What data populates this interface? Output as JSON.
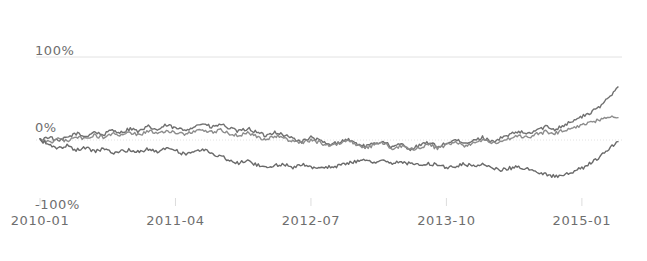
{
  "chart_data": {
    "type": "line",
    "title": "",
    "subtitle": "",
    "xlabel": "",
    "ylabel": "",
    "grid": true,
    "legend_position": "none",
    "background_color": "#ffffff",
    "axis_text_color": "#6e6e6e",
    "gridline_color": "#e2e2e2",
    "ylim": [
      -100,
      100
    ],
    "ytick_labels": [
      "100%",
      "0%",
      "-100%"
    ],
    "ytick_values": [
      100,
      0,
      -100
    ],
    "xtick_labels": [
      "2010-01",
      "2011-04",
      "2012-07",
      "2013-10",
      "2015-01"
    ],
    "xtick_positions": [
      0,
      15,
      30,
      45,
      60
    ],
    "x_unit": "months since 2010-01",
    "x": [
      0,
      1,
      2,
      3,
      4,
      5,
      6,
      7,
      8,
      9,
      10,
      11,
      12,
      13,
      14,
      15,
      16,
      17,
      18,
      19,
      20,
      21,
      22,
      23,
      24,
      25,
      26,
      27,
      28,
      29,
      30,
      31,
      32,
      33,
      34,
      35,
      36,
      37,
      38,
      39,
      40,
      41,
      42,
      43,
      44,
      45,
      46,
      47,
      48,
      49,
      50,
      51,
      52,
      53,
      54,
      55,
      56,
      57,
      58,
      59,
      60,
      61,
      62,
      63,
      64
    ],
    "series": [
      {
        "name": "series-1",
        "color": "#707070",
        "line_width": 1.4,
        "values": [
          0,
          4,
          -2,
          3,
          8,
          4,
          10,
          6,
          12,
          9,
          14,
          10,
          16,
          12,
          18,
          14,
          12,
          16,
          20,
          15,
          19,
          14,
          10,
          14,
          9,
          5,
          10,
          6,
          2,
          -2,
          3,
          -1,
          -6,
          -3,
          1,
          -4,
          -8,
          -5,
          -1,
          -9,
          -5,
          -11,
          -7,
          -3,
          -8,
          -4,
          0,
          -5,
          -1,
          3,
          -2,
          2,
          6,
          10,
          7,
          12,
          16,
          13,
          18,
          23,
          28,
          33,
          40,
          52,
          64
        ]
      },
      {
        "name": "series-2",
        "color": "#8c8c8c",
        "line_width": 1.4,
        "values": [
          0,
          -3,
          2,
          -1,
          4,
          1,
          6,
          3,
          8,
          5,
          9,
          6,
          11,
          8,
          12,
          9,
          7,
          10,
          13,
          9,
          12,
          8,
          5,
          8,
          4,
          1,
          5,
          2,
          -1,
          -4,
          0,
          -3,
          -7,
          -4,
          -1,
          -5,
          -9,
          -6,
          -3,
          -10,
          -7,
          -12,
          -9,
          -5,
          -10,
          -6,
          -2,
          -7,
          -3,
          0,
          -4,
          -1,
          2,
          5,
          3,
          7,
          10,
          8,
          12,
          15,
          18,
          21,
          24,
          27,
          27
        ]
      },
      {
        "name": "series-3",
        "color": "#6a6a6a",
        "line_width": 1.4,
        "values": [
          0,
          -6,
          -10,
          -7,
          -12,
          -9,
          -14,
          -11,
          -16,
          -13,
          -12,
          -15,
          -11,
          -14,
          -10,
          -13,
          -17,
          -14,
          -12,
          -16,
          -20,
          -24,
          -28,
          -25,
          -30,
          -34,
          -31,
          -29,
          -33,
          -30,
          -32,
          -35,
          -33,
          -31,
          -28,
          -26,
          -24,
          -27,
          -25,
          -28,
          -26,
          -29,
          -31,
          -28,
          -30,
          -33,
          -31,
          -29,
          -32,
          -30,
          -33,
          -36,
          -34,
          -32,
          -35,
          -38,
          -41,
          -44,
          -42,
          -39,
          -34,
          -28,
          -20,
          -10,
          -2
        ]
      }
    ]
  }
}
